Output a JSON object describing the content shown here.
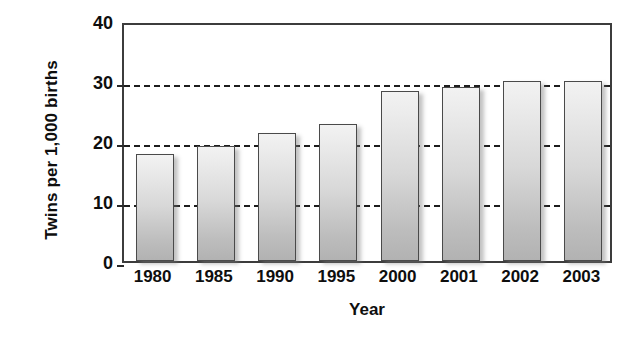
{
  "chart_data": {
    "type": "bar",
    "title": "",
    "xlabel": "Year",
    "ylabel": "Twins per 1,000 births",
    "categories": [
      "1980",
      "1985",
      "1990",
      "1995",
      "2000",
      "2001",
      "2002",
      "2003"
    ],
    "values": [
      17.8,
      19.2,
      21.3,
      22.8,
      28.3,
      29.0,
      30.0,
      30.0
    ],
    "ylim": [
      0,
      40
    ],
    "yticks": [
      0,
      10,
      20,
      30,
      40
    ],
    "ytick_labels": [
      "0",
      "10",
      "20",
      "30",
      "40"
    ],
    "gridlines": [
      10,
      20,
      30
    ],
    "grid": "horizontal-dashed",
    "legend": "none",
    "series": [
      {
        "name": "Twins per 1,000 births",
        "values": [
          17.8,
          19.2,
          21.3,
          22.8,
          28.3,
          29.0,
          30.0,
          30.0
        ]
      }
    ],
    "colors": {
      "bar_top": "#f2f2f2",
      "bar_bottom": "#b2b2b2",
      "bar_edge": "#4a4a4a",
      "axis": "#3c3c3c",
      "grid": "#1d1d1d",
      "text": "#0e0e0e",
      "background": "#ffffff"
    }
  }
}
